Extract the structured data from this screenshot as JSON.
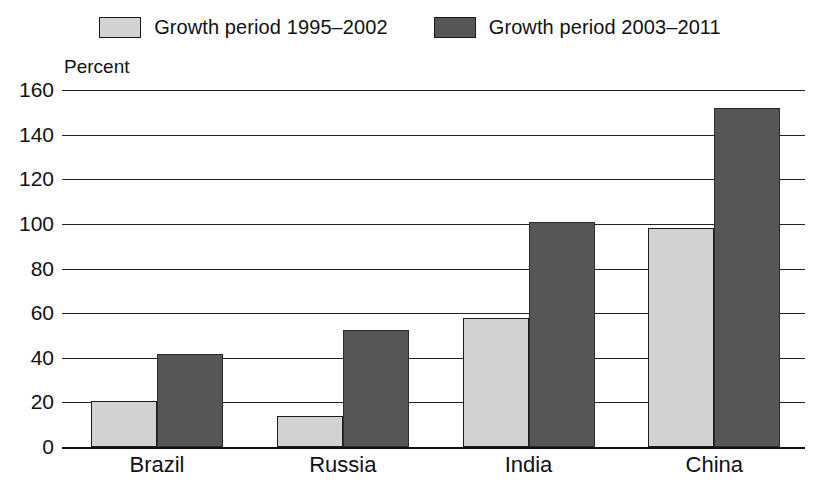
{
  "chart_data": {
    "type": "bar",
    "title": "",
    "xlabel": "",
    "ylabel": "Percent",
    "ylim": [
      0,
      160
    ],
    "yticks": [
      0,
      20,
      40,
      60,
      80,
      100,
      120,
      140,
      160
    ],
    "grid": true,
    "legend_position": "top-center",
    "categories": [
      "Brazil",
      "Russia",
      "India",
      "China"
    ],
    "series": [
      {
        "name": "Growth period 1995–2002",
        "color": "#d2d2d2",
        "values": [
          20.5,
          14,
          58,
          98
        ]
      },
      {
        "name": "Growth period 2003–2011",
        "color": "#565656",
        "values": [
          41.5,
          52.5,
          101,
          152
        ]
      }
    ]
  },
  "legend": {
    "items": [
      {
        "label": "Growth period 1995–2002",
        "swatch": "light"
      },
      {
        "label": "Growth period 2003–2011",
        "swatch": "dark"
      }
    ]
  },
  "axes": {
    "y_title": "Percent",
    "y_tick_labels": [
      "160",
      "140",
      "120",
      "100",
      "80",
      "60",
      "40",
      "20",
      "0"
    ],
    "x_tick_labels": [
      "Brazil",
      "Russia",
      "India",
      "China"
    ]
  }
}
